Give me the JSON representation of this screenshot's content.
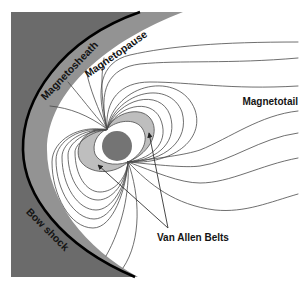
{
  "diagram": {
    "labels": {
      "magnetosheath": "Magnetosheath",
      "magnetopause": "Magnetopause",
      "bow_shock": "Bow shock",
      "magnetotail": "Magnetotail",
      "van_allen_belts": "Van Allen Belts"
    },
    "colors": {
      "solar_wind_region": "#6b6b6b",
      "magnetosheath": "#939393",
      "bow_shock": "#000000",
      "van_allen_belts": "#bebebe",
      "earth": "#747474",
      "field_lines": "#4a4a4a",
      "background": "#ffffff"
    }
  }
}
